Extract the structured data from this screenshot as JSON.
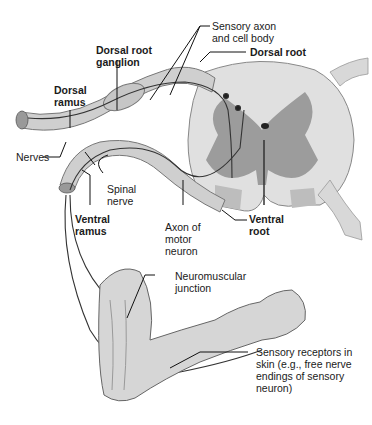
{
  "diagram": {
    "type": "anatomical illustration",
    "labels": {
      "sensory_axon": [
        "Sensory axon",
        "and cell body"
      ],
      "dorsal_root_ganglion": [
        "Dorsal root",
        "ganglion"
      ],
      "dorsal_root": "Dorsal root",
      "dorsal_ramus": [
        "Dorsal",
        "ramus"
      ],
      "nerves": "Nerves",
      "spinal_nerve": [
        "Spinal",
        "nerve"
      ],
      "ventral_ramus": [
        "Ventral",
        "ramus"
      ],
      "axon_motor": [
        "Axon of",
        "motor",
        "neuron"
      ],
      "ventral_root": [
        "Ventral",
        "root"
      ],
      "neuromuscular": [
        "Neuromuscular",
        "junction"
      ],
      "sensory_receptors": [
        "Sensory receptors in",
        "skin (e.g., free nerve",
        "endings of sensory",
        "neuron)"
      ]
    },
    "colors": {
      "background": "#ffffff",
      "white_matter": "#e2e2e2",
      "gray_matter": "#9a9a9a",
      "nerve": "#cfcfcf",
      "skin": "#d9d9d9",
      "line": "#1a1a1a"
    }
  }
}
